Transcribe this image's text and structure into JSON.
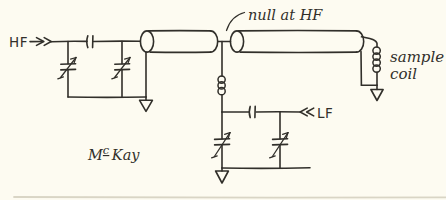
{
  "diagram": {
    "labels": {
      "hf_input": "HF",
      "null_annotation": "null at HF",
      "sample_coil_line1": "sample",
      "sample_coil_line2": "coil",
      "lf_input": "LF",
      "author_m": "M",
      "author_c": "c",
      "author_kay": "Kay"
    },
    "colors": {
      "ink": "#312f2a",
      "paper": "#fdfbf1",
      "faint_line": "#d9d5c5"
    }
  }
}
